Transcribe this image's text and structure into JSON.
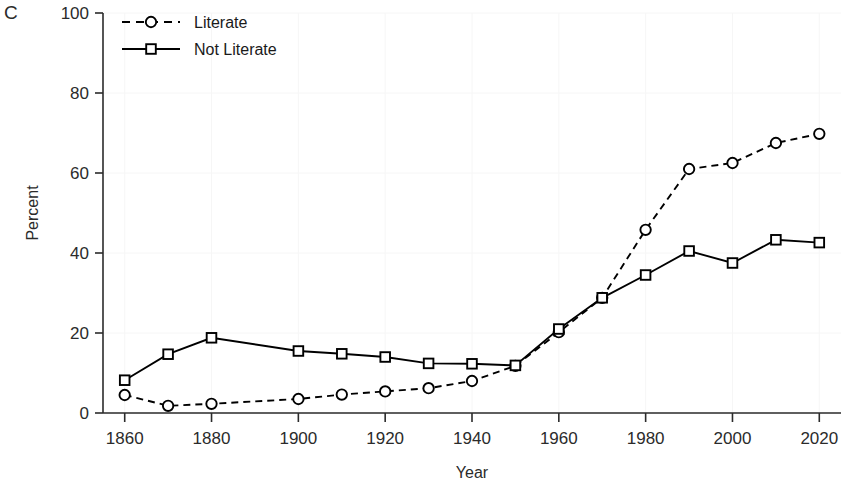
{
  "panel": {
    "label": "C"
  },
  "chart_data": {
    "type": "line",
    "title": "",
    "xlabel": "Year",
    "ylabel": "Percent",
    "xlim": [
      1855,
      2025
    ],
    "ylim": [
      0,
      100
    ],
    "xticks": [
      1860,
      1880,
      1900,
      1920,
      1940,
      1960,
      1980,
      2000,
      2020
    ],
    "yticks": [
      0,
      20,
      40,
      60,
      80,
      100
    ],
    "xtick_labels": [
      "1860",
      "1880",
      "1900",
      "1920",
      "1940",
      "1960",
      "1980",
      "2000",
      "2020"
    ],
    "ytick_labels": [
      "0",
      "20",
      "40",
      "60",
      "80",
      "100"
    ],
    "grid": false,
    "legend_position": "top-left",
    "x": [
      1860,
      1870,
      1880,
      1900,
      1910,
      1920,
      1930,
      1940,
      1950,
      1960,
      1970,
      1980,
      1990,
      2000,
      2010,
      2020
    ],
    "series": [
      {
        "name": "Literate",
        "marker": "circle",
        "line_style": "dashed",
        "color": "#000000",
        "values": [
          4.5,
          1.8,
          2.3,
          3.5,
          4.6,
          5.4,
          6.2,
          8.0,
          11.8,
          20.2,
          28.8,
          45.8,
          61.0,
          62.5,
          67.5,
          69.8
        ]
      },
      {
        "name": "Not Literate",
        "marker": "square",
        "line_style": "solid",
        "color": "#000000",
        "values": [
          8.2,
          14.7,
          18.8,
          15.5,
          14.8,
          14.0,
          12.4,
          12.3,
          11.9,
          21.0,
          28.8,
          34.5,
          40.5,
          37.5,
          43.3,
          42.6
        ]
      }
    ]
  },
  "legend": {
    "items": [
      {
        "label": "Literate",
        "marker": "circle",
        "line_style": "dashed"
      },
      {
        "label": "Not Literate",
        "marker": "square",
        "line_style": "solid"
      }
    ]
  }
}
